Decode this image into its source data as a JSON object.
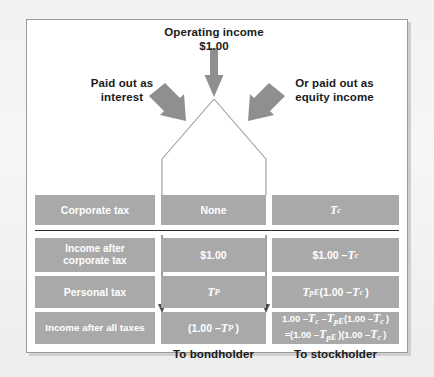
{
  "diagram": {
    "title_line1": "Operating income",
    "title_line2": "$1.00",
    "branch_left_line1": "Paid out as",
    "branch_left_line2": "interest",
    "branch_right_line1": "Or paid out as",
    "branch_right_line2": "equity income",
    "footer_left": "To bondholder",
    "footer_right": "To stockholder",
    "colors": {
      "cell_fill": "#a9a9a9",
      "cell_text": "#ffffff",
      "arrow": "#8f8f8f",
      "line": "#8f8f8f",
      "divider": "#2b2b2b",
      "frame_border": "#9b9b9b",
      "page_background": "#f2f2f2"
    },
    "rows": [
      {
        "id": "corporate-tax",
        "label": "Corporate tax",
        "debt_value": "None",
        "equity_value": "Tc"
      },
      {
        "id": "income-after-corporate-tax",
        "label_line1": "Income after",
        "label_line2": "corporate tax",
        "label": "Income after corporate tax",
        "debt_value": "$1.00",
        "equity_value": "$1.00 – Tc"
      },
      {
        "id": "personal-tax",
        "label": "Personal tax",
        "debt_value": "TP",
        "equity_value": "TpE(1.00 – Tc )"
      },
      {
        "id": "income-after-all-taxes",
        "label": "Income after all taxes",
        "debt_value": "(1.00 – TP )",
        "equity_value_line1": "1.00 – Tc – TpE(1.00 – Tc )",
        "equity_value_line2": "=(1.00 – TpE )(1.00 – Tc )"
      }
    ]
  }
}
